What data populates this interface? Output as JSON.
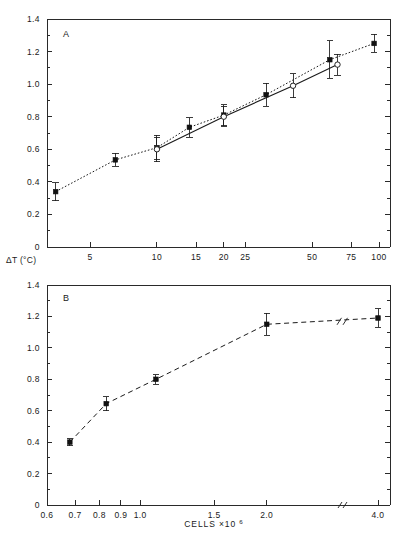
{
  "figure": {
    "y_axis_label": "ΔT (°C)",
    "x_axis_label": "CELLS ×10",
    "x_axis_label_exp": "6"
  },
  "panel_a": {
    "letter": "A"
  },
  "panel_b": {
    "letter": "B"
  },
  "chart_data": [
    {
      "type": "line",
      "panel": "A",
      "title": "A",
      "xlabel": "",
      "ylabel": "ΔT (°C)",
      "xscale": "log",
      "xlim": [
        3.2,
        112
      ],
      "ylim": [
        0,
        1.4
      ],
      "xticks": [
        5,
        10,
        15,
        20,
        25,
        50,
        75,
        100
      ],
      "xticklabels": [
        "5",
        "10",
        "15",
        "20",
        "25",
        "50",
        "75",
        "100"
      ],
      "yticks": [
        0,
        0.2,
        0.4,
        0.6,
        0.8,
        1.0,
        1.2,
        1.4
      ],
      "yticklabels": [
        "0",
        "0.2",
        "0.4",
        "0.6",
        "0.8",
        "1.0",
        "1.2",
        "1.4"
      ],
      "y_minor_ticks": [
        0.1,
        0.3,
        0.5,
        0.7,
        0.9,
        1.1,
        1.3
      ],
      "grid": false,
      "legend": false,
      "series": [
        {
          "name": "filled-square-dotted",
          "marker": "filled-square",
          "linestyle": "dotted",
          "x": [
            3.5,
            6.5,
            10.0,
            14.0,
            20.0,
            31.0,
            60.0,
            95.0
          ],
          "y": [
            0.34,
            0.535,
            0.61,
            0.735,
            0.81,
            0.935,
            1.15,
            1.25
          ],
          "yerr": [
            0.055,
            0.04,
            0.075,
            0.06,
            0.065,
            0.07,
            0.115,
            0.055
          ]
        },
        {
          "name": "open-circle-solid",
          "marker": "open-circle",
          "linestyle": "solid",
          "x": [
            10.0,
            20.0,
            41.0,
            65.0
          ],
          "y": [
            0.6,
            0.8,
            0.99,
            1.12
          ],
          "yerr": [
            0.075,
            0.06,
            0.075,
            0.065
          ]
        }
      ]
    },
    {
      "type": "line",
      "panel": "B",
      "title": "B",
      "xlabel": "CELLS ×10⁶",
      "ylabel": "ΔT (°C)",
      "xscale": "log-with-break",
      "ylim": [
        0,
        1.4
      ],
      "xticks": [
        0.6,
        0.7,
        0.8,
        0.9,
        1.0,
        1.5,
        2.0,
        4.0
      ],
      "xticklabels": [
        "0.6",
        "0.7",
        "0.8",
        "0.9",
        "1.0",
        "1.5",
        "2.0",
        "4.0"
      ],
      "yticks": [
        0,
        0.2,
        0.4,
        0.6,
        0.8,
        1.0,
        1.2,
        1.4
      ],
      "yticklabels": [
        "0",
        "0.2",
        "0.4",
        "0.6",
        "0.8",
        "1.0",
        "1.2",
        "1.4"
      ],
      "y_minor_ticks": [
        0.1,
        0.3,
        0.5,
        0.7,
        0.9,
        1.1,
        1.3
      ],
      "axis_break": true,
      "grid": false,
      "legend": false,
      "series": [
        {
          "name": "filled-square-dashed",
          "marker": "filled-square",
          "linestyle": "dashed",
          "x": [
            0.68,
            0.83,
            1.09,
            2.0,
            4.0
          ],
          "y": [
            0.4,
            0.645,
            0.8,
            1.15,
            1.19
          ],
          "yerr": [
            0.022,
            0.045,
            0.03,
            0.07,
            0.06
          ]
        }
      ]
    }
  ]
}
